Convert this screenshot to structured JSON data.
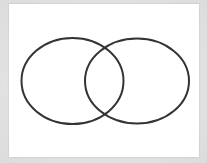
{
  "diagram": {
    "type": "venn",
    "sets": [
      {
        "name": "left-set",
        "label": ""
      },
      {
        "name": "right-set",
        "label": ""
      }
    ],
    "colors": {
      "background": "#e0e0e0",
      "card": "#ffffff",
      "stroke": "#333333"
    }
  }
}
